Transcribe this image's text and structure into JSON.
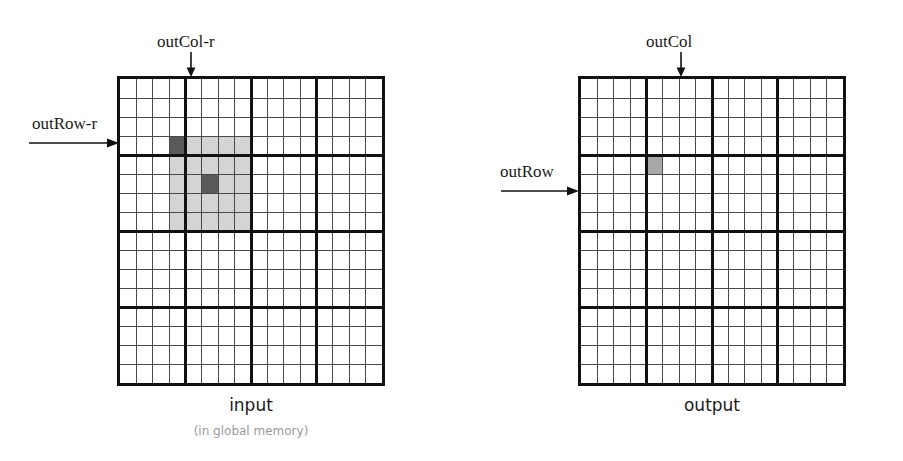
{
  "figure": {
    "type": "diagram"
  },
  "labels": {
    "out_col_r": "outCol-r",
    "out_row_r": "outRow-r",
    "out_col": "outCol",
    "out_row": "outRow"
  },
  "captions": {
    "input_title": "input",
    "input_subtitle": "(in global memory)",
    "output_title": "output"
  },
  "colors": {
    "grid_line_thin": "#4a4a4a",
    "grid_line_thick": "#111111",
    "cell_dark": "#595959",
    "cell_light": "#d4d4d4",
    "background": "#ffffff",
    "text": "#1a1a1a",
    "subtitle_text": "#9a9a9a"
  },
  "input_grid": {
    "name": "input",
    "rows": 16,
    "cols": 16,
    "block_rows": 4,
    "block_cols": 4,
    "highlight": {
      "anchor_dark_cell": {
        "row": 3,
        "col": 3
      },
      "light_region": {
        "row_start": 3,
        "col_start": 3,
        "row_end": 7,
        "col_end": 7
      },
      "center_dark_cell": {
        "row": 5,
        "col": 5
      }
    },
    "pointer_col_index": 4,
    "pointer_row_index": 4
  },
  "output_grid": {
    "name": "output",
    "rows": 16,
    "cols": 16,
    "block_rows": 4,
    "block_cols": 4,
    "highlight": {
      "gray_cell": {
        "row": 4,
        "col": 4
      }
    },
    "pointer_col_index": 4,
    "pointer_row_index": 4
  },
  "chart_data": {
    "type": "heatmap",
    "title": "",
    "grids": [
      {
        "name": "input",
        "caption": "input",
        "sub_caption": "(in global memory)",
        "rows": 16,
        "cols": 16,
        "tile_size": 4,
        "shaded_cells": [
          {
            "row": 3,
            "col": 3,
            "shade": "dark"
          },
          {
            "row": 3,
            "col": 4,
            "shade": "light"
          },
          {
            "row": 3,
            "col": 5,
            "shade": "light"
          },
          {
            "row": 3,
            "col": 6,
            "shade": "light"
          },
          {
            "row": 3,
            "col": 7,
            "shade": "light"
          },
          {
            "row": 4,
            "col": 3,
            "shade": "light"
          },
          {
            "row": 4,
            "col": 4,
            "shade": "light"
          },
          {
            "row": 4,
            "col": 5,
            "shade": "light"
          },
          {
            "row": 4,
            "col": 6,
            "shade": "light"
          },
          {
            "row": 4,
            "col": 7,
            "shade": "light"
          },
          {
            "row": 5,
            "col": 3,
            "shade": "light"
          },
          {
            "row": 5,
            "col": 4,
            "shade": "light"
          },
          {
            "row": 5,
            "col": 5,
            "shade": "dark"
          },
          {
            "row": 5,
            "col": 6,
            "shade": "light"
          },
          {
            "row": 5,
            "col": 7,
            "shade": "light"
          },
          {
            "row": 6,
            "col": 3,
            "shade": "light"
          },
          {
            "row": 6,
            "col": 4,
            "shade": "light"
          },
          {
            "row": 6,
            "col": 5,
            "shade": "light"
          },
          {
            "row": 6,
            "col": 6,
            "shade": "light"
          },
          {
            "row": 6,
            "col": 7,
            "shade": "light"
          },
          {
            "row": 7,
            "col": 3,
            "shade": "light"
          },
          {
            "row": 7,
            "col": 4,
            "shade": "light"
          },
          {
            "row": 7,
            "col": 5,
            "shade": "light"
          },
          {
            "row": 7,
            "col": 6,
            "shade": "light"
          },
          {
            "row": 7,
            "col": 7,
            "shade": "light"
          }
        ],
        "annotations": [
          {
            "text": "outCol-r",
            "edge": "top",
            "points_to_col": 4
          },
          {
            "text": "outRow-r",
            "edge": "left",
            "points_to_row": 4
          }
        ]
      },
      {
        "name": "output",
        "caption": "output",
        "sub_caption": "",
        "rows": 16,
        "cols": 16,
        "tile_size": 4,
        "shaded_cells": [
          {
            "row": 4,
            "col": 4,
            "shade": "mid"
          }
        ],
        "annotations": [
          {
            "text": "outCol",
            "edge": "top",
            "points_to_col": 4
          },
          {
            "text": "outRow",
            "edge": "left",
            "points_to_row": 4
          }
        ]
      }
    ]
  }
}
